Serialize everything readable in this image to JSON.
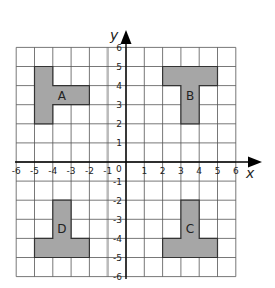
{
  "diagram": {
    "type": "coordinate-grid",
    "x_range": [
      -6,
      6
    ],
    "y_range": [
      -6,
      6
    ],
    "axis_labels": {
      "x": "x",
      "y": "y"
    },
    "origin_label": "0",
    "x_ticks": [
      "-6",
      "-5",
      "-4",
      "-3",
      "-2",
      "-1",
      "1",
      "2",
      "3",
      "4",
      "5",
      "6"
    ],
    "y_ticks": [
      "6",
      "5",
      "4",
      "3",
      "2",
      "1",
      "-1",
      "-2",
      "-3",
      "-4",
      "-5",
      "-6"
    ],
    "fill_color": "#a6a6a6",
    "shapes": [
      {
        "label": "A",
        "vertices": [
          [
            -5,
            5
          ],
          [
            -4,
            5
          ],
          [
            -4,
            4
          ],
          [
            -2,
            4
          ],
          [
            -2,
            3
          ],
          [
            -4,
            3
          ],
          [
            -4,
            2
          ],
          [
            -5,
            2
          ]
        ],
        "label_pos": [
          -3.5,
          3.5
        ]
      },
      {
        "label": "B",
        "vertices": [
          [
            2,
            5
          ],
          [
            5,
            5
          ],
          [
            5,
            4
          ],
          [
            4,
            4
          ],
          [
            4,
            2
          ],
          [
            3,
            2
          ],
          [
            3,
            4
          ],
          [
            2,
            4
          ]
        ],
        "label_pos": [
          3.5,
          3.5
        ]
      },
      {
        "label": "C",
        "vertices": [
          [
            3,
            -2
          ],
          [
            4,
            -2
          ],
          [
            4,
            -4
          ],
          [
            5,
            -4
          ],
          [
            5,
            -5
          ],
          [
            2,
            -5
          ],
          [
            2,
            -4
          ],
          [
            3,
            -4
          ]
        ],
        "label_pos": [
          3.5,
          -3.5
        ]
      },
      {
        "label": "D",
        "vertices": [
          [
            -4,
            -2
          ],
          [
            -3,
            -2
          ],
          [
            -3,
            -4
          ],
          [
            -2,
            -4
          ],
          [
            -2,
            -5
          ],
          [
            -5,
            -5
          ],
          [
            -5,
            -4
          ],
          [
            -4,
            -4
          ]
        ],
        "label_pos": [
          -3.5,
          -3.5
        ]
      }
    ]
  }
}
